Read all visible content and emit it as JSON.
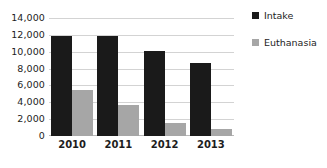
{
  "chart_data": {
    "type": "bar",
    "title": "",
    "subtitle": "",
    "xlabel": "",
    "ylabel": "",
    "categories": [
      "2010",
      "2011",
      "2012",
      "2013"
    ],
    "series": [
      {
        "name": "Intake",
        "color": "#1a1a1a",
        "values": [
          11900,
          11850,
          10100,
          8700
        ]
      },
      {
        "name": "Euthanasia",
        "color": "#a6a6a6",
        "values": [
          5500,
          3700,
          1500,
          850
        ]
      }
    ],
    "ylim": [
      0,
      14000
    ],
    "ytick_step": 2000,
    "ytick_labels": [
      "14,000",
      "12,000",
      "10,000",
      "8,000",
      "6,000",
      "4,000",
      "2,000",
      "0"
    ],
    "ytick_values": [
      14000,
      12000,
      10000,
      8000,
      6000,
      4000,
      2000,
      0
    ],
    "grid": true,
    "grid_axis": "y",
    "grid_color": "#d3d3d3",
    "legend_position": "right",
    "background": "#ffffff"
  },
  "legend": {
    "entries": [
      {
        "label": "Intake",
        "swatch_name": "legend-swatch-intake"
      },
      {
        "label": "Euthanasia",
        "swatch_name": "legend-swatch-euthanasia"
      }
    ]
  }
}
